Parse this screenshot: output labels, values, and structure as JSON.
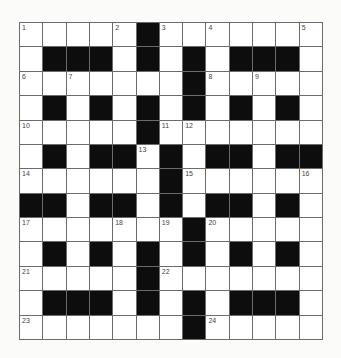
{
  "puzzle": {
    "rows": 13,
    "cols": 13,
    "grid": [
      "....._..._....",
      "x"
    ],
    "layout": [
      "WWWWWBWWWWWWW",
      "WBBBWBWBWBBBW",
      "WWWWWWWBWWWWW",
      "WBWBWBWBWBWBW",
      "WWWWWBWWWWWWW",
      "WBWBBWBWBBWBB",
      "WWWWWWBWWWWWW",
      "BBWBBWBWBBWBW",
      "WWWWWWWBWWWWW",
      "WBWBWBWBWBWBW",
      "WWWWWBWWWWWWW",
      "WBBBWBWBWBBBW",
      "WWWWWWWBWWWWW"
    ],
    "numbers": [
      {
        "r": 0,
        "c": 0,
        "n": "1"
      },
      {
        "r": 0,
        "c": 4,
        "n": "2"
      },
      {
        "r": 0,
        "c": 6,
        "n": "3"
      },
      {
        "r": 0,
        "c": 8,
        "n": "4"
      },
      {
        "r": 0,
        "c": 12,
        "n": "5"
      },
      {
        "r": 2,
        "c": 0,
        "n": "6"
      },
      {
        "r": 2,
        "c": 2,
        "n": "7"
      },
      {
        "r": 2,
        "c": 8,
        "n": "8"
      },
      {
        "r": 2,
        "c": 10,
        "n": "9"
      },
      {
        "r": 4,
        "c": 0,
        "n": "10"
      },
      {
        "r": 4,
        "c": 6,
        "n": "11"
      },
      {
        "r": 4,
        "c": 7,
        "n": "12"
      },
      {
        "r": 5,
        "c": 5,
        "n": "13"
      },
      {
        "r": 6,
        "c": 0,
        "n": "14"
      },
      {
        "r": 6,
        "c": 7,
        "n": "15"
      },
      {
        "r": 6,
        "c": 12,
        "n": "16"
      },
      {
        "r": 8,
        "c": 0,
        "n": "17"
      },
      {
        "r": 8,
        "c": 4,
        "n": "18"
      },
      {
        "r": 8,
        "c": 6,
        "n": "19"
      },
      {
        "r": 8,
        "c": 8,
        "n": "20"
      },
      {
        "r": 10,
        "c": 0,
        "n": "21"
      },
      {
        "r": 10,
        "c": 6,
        "n": "22"
      },
      {
        "r": 12,
        "c": 0,
        "n": "23"
      },
      {
        "r": 12,
        "c": 8,
        "n": "24"
      }
    ],
    "colors": {
      "block": "#0d0d0d",
      "cell": "#ffffff",
      "gridline": "#6b6b6b",
      "number": "#444444"
    }
  }
}
